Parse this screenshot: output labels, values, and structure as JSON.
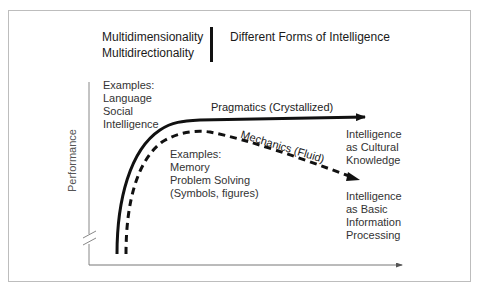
{
  "header": {
    "left_line1": "Multidimensionality",
    "left_line2": "Multidirectionality",
    "right": "Different Forms of Intelligence"
  },
  "axes": {
    "y_label": "Performance",
    "x_label": ""
  },
  "curves": {
    "pragmatics": {
      "label": "Pragmatics (Crystallized)",
      "style": "solid",
      "examples": [
        "Examples:",
        "Language",
        "Social",
        "Intelligence"
      ],
      "outcome": [
        "Intelligence",
        "as Cultural",
        "Knowledge"
      ]
    },
    "mechanics": {
      "label": "Mechanics (Fluid)",
      "style": "dashed",
      "examples": [
        "Examples:",
        "Memory",
        "Problem Solving",
        "(Symbols, figures)"
      ],
      "outcome": [
        "Intelligence",
        "as Basic",
        "Information",
        "Processing"
      ]
    }
  },
  "colors": {
    "line": "#111111",
    "axis": "#888888",
    "border": "#bdbdbd",
    "text": "#333333"
  }
}
